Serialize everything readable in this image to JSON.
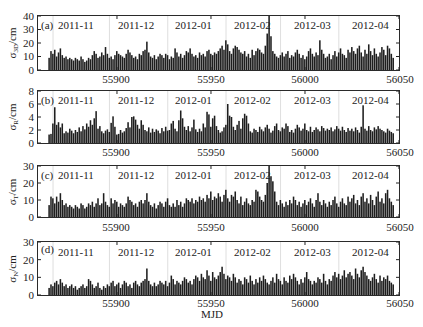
{
  "figure": {
    "xlabel": "MJD"
  },
  "chart_data": [
    {
      "type": "bar",
      "panel": "(a)",
      "ylabel": {
        "symbol": "σ",
        "sub": "3D",
        "unit": "/cm"
      },
      "xlabel": "MJD",
      "xlim": [
        55858,
        56050
      ],
      "ylim": [
        0,
        40
      ],
      "xticks": [
        "55900",
        "55950",
        "56000",
        "56050"
      ],
      "yticks": [
        "0",
        "10",
        "20",
        "30",
        "40"
      ],
      "months": [
        "2011-11",
        "2011-12",
        "2012-01",
        "2012-02",
        "2012-03",
        "2012-04"
      ],
      "month_starts": [
        55866,
        55896,
        55927,
        55958,
        55987,
        56018
      ],
      "x": {
        "start": 55864,
        "step": 1,
        "count": 184
      },
      "values": [
        9,
        14,
        12,
        15,
        10,
        13,
        16,
        11,
        9,
        10,
        8,
        9,
        8,
        7,
        9,
        8,
        7,
        10,
        8,
        6,
        7,
        9,
        8,
        11,
        14,
        12,
        9,
        10,
        13,
        11,
        17,
        12,
        9,
        10,
        8,
        11,
        14,
        12,
        11,
        10,
        9,
        12,
        15,
        13,
        11,
        9,
        10,
        8,
        12,
        11,
        14,
        15,
        21,
        13,
        10,
        9,
        11,
        8,
        10,
        12,
        11,
        9,
        12,
        11,
        8,
        10,
        9,
        16,
        13,
        10,
        12,
        9,
        11,
        14,
        13,
        16,
        12,
        10,
        11,
        9,
        13,
        11,
        12,
        10,
        14,
        15,
        12,
        11,
        13,
        12,
        14,
        16,
        18,
        15,
        22,
        19,
        14,
        12,
        16,
        18,
        17,
        15,
        13,
        12,
        14,
        10,
        12,
        9,
        15,
        11,
        14,
        16,
        15,
        13,
        12,
        18,
        27,
        40,
        25,
        14,
        12,
        10,
        9,
        11,
        13,
        10,
        12,
        14,
        9,
        11,
        10,
        13,
        15,
        12,
        9,
        11,
        8,
        10,
        14,
        16,
        12,
        10,
        13,
        11,
        22,
        15,
        12,
        9,
        10,
        12,
        8,
        11,
        14,
        10,
        13,
        16,
        12,
        11,
        9,
        15,
        13,
        17,
        14,
        12,
        16,
        18,
        13,
        10,
        15,
        12,
        19,
        14,
        11,
        16,
        12,
        10,
        13,
        17,
        15,
        11,
        18,
        16,
        12,
        9
      ]
    },
    {
      "type": "bar",
      "panel": "(b)",
      "ylabel": {
        "symbol": "σ",
        "sub": "R",
        "unit": "/cm"
      },
      "xlabel": "MJD",
      "xlim": [
        55858,
        56050
      ],
      "ylim": [
        0,
        8
      ],
      "xticks": [
        "55900",
        "55950",
        "56000",
        "56050"
      ],
      "yticks": [
        "0",
        "2",
        "4",
        "6",
        "8"
      ],
      "months": [
        "2011-11",
        "2011-12",
        "2012-01",
        "2012-02",
        "2012-03",
        "2012-04"
      ],
      "month_starts": [
        55866,
        55896,
        55927,
        55958,
        55987,
        56018
      ],
      "x": {
        "start": 55864,
        "step": 1,
        "count": 184
      },
      "values": [
        1.3,
        1.4,
        3.0,
        5.5,
        2.8,
        3.2,
        2.4,
        3.0,
        1.5,
        1.8,
        1.6,
        2.2,
        1.9,
        1.5,
        2.0,
        1.7,
        2.4,
        1.8,
        2.6,
        2.1,
        3.0,
        2.5,
        3.5,
        2.8,
        3.8,
        4.9,
        2.2,
        2.6,
        1.8,
        1.5,
        1.9,
        2.1,
        1.7,
        3.1,
        4.1,
        2.5,
        1.3,
        1.4,
        2.0,
        1.6,
        1.8,
        2.3,
        3.2,
        2.4,
        4.0,
        4.1,
        3.6,
        2.8,
        2.2,
        3.5,
        2.8,
        2.0,
        1.8,
        2.4,
        1.6,
        2.2,
        1.7,
        2.1,
        1.9,
        1.5,
        2.3,
        1.8,
        2.5,
        1.9,
        2.0,
        3.0,
        3.4,
        2.2,
        1.8,
        3.5,
        5.0,
        3.8,
        2.5,
        2.0,
        2.6,
        1.8,
        2.4,
        3.6,
        2.1,
        1.7,
        2.2,
        1.8,
        3.0,
        2.4,
        4.8,
        4.4,
        2.5,
        3.8,
        4.2,
        2.6,
        2.0,
        1.6,
        1.8,
        2.4,
        2.8,
        6.0,
        4.2,
        4.0,
        2.5,
        2.0,
        2.8,
        3.4,
        2.2,
        3.8,
        4.5,
        4.2,
        3.0,
        1.8,
        1.6,
        2.2,
        2.0,
        1.7,
        2.5,
        2.1,
        1.8,
        2.4,
        2.8,
        2.2,
        1.6,
        1.9,
        2.6,
        3.0,
        2.0,
        1.8,
        2.4,
        2.2,
        3.0,
        2.6,
        1.7,
        2.0,
        1.6,
        2.2,
        2.8,
        2.4,
        1.9,
        2.2,
        3.0,
        2.0,
        1.8,
        2.5,
        1.7,
        2.0,
        2.4,
        2.1,
        1.8,
        2.6,
        2.3,
        1.9,
        2.2,
        2.0,
        2.4,
        1.8,
        2.1,
        2.6,
        2.2,
        1.9,
        2.5,
        2.0,
        1.7,
        2.3,
        1.9,
        2.2,
        1.8,
        2.4,
        2.0,
        1.6,
        2.5,
        5.8,
        2.2,
        1.9,
        2.6,
        2.0,
        1.8,
        2.4,
        2.1,
        2.6,
        2.2,
        2.0,
        1.8,
        1.6,
        2.2,
        1.9,
        1.7,
        1.5
      ]
    },
    {
      "type": "bar",
      "panel": "(c)",
      "ylabel": {
        "symbol": "σ",
        "sub": "T",
        "unit": "/cm"
      },
      "xlabel": "MJD",
      "xlim": [
        55858,
        56050
      ],
      "ylim": [
        0,
        30
      ],
      "xticks": [
        "55900",
        "55950",
        "56000",
        "56050"
      ],
      "yticks": [
        "0",
        "10",
        "20",
        "30"
      ],
      "months": [
        "2011-11",
        "2011-12",
        "2012-01",
        "2012-02",
        "2012-03",
        "2012-04"
      ],
      "month_starts": [
        55866,
        55896,
        55927,
        55958,
        55987,
        56018
      ],
      "x": {
        "start": 55864,
        "step": 1,
        "count": 184
      },
      "values": [
        7,
        12,
        11,
        8,
        12,
        9,
        14,
        10,
        7,
        8,
        6,
        7,
        6,
        5,
        7,
        6,
        5,
        8,
        7,
        5,
        6,
        8,
        7,
        9,
        6,
        8,
        11,
        7,
        8,
        14,
        9,
        7,
        6,
        11,
        8,
        10,
        9,
        6,
        8,
        7,
        6,
        8,
        12,
        10,
        9,
        7,
        8,
        6,
        9,
        10,
        8,
        10,
        14,
        9,
        7,
        6,
        8,
        5,
        7,
        9,
        8,
        6,
        9,
        11,
        7,
        6,
        8,
        6,
        10,
        7,
        9,
        6,
        8,
        11,
        10,
        9,
        11,
        8,
        10,
        9,
        12,
        10,
        11,
        9,
        13,
        11,
        15,
        10,
        12,
        11,
        14,
        12,
        9,
        13,
        16,
        11,
        9,
        13,
        12,
        15,
        10,
        8,
        12,
        7,
        9,
        11,
        8,
        7,
        10,
        9,
        16,
        15,
        12,
        10,
        9,
        13,
        20,
        30,
        24,
        21,
        15,
        9,
        7,
        10,
        8,
        6,
        9,
        7,
        10,
        8,
        12,
        10,
        7,
        9,
        6,
        8,
        10,
        7,
        9,
        11,
        8,
        6,
        10,
        14,
        9,
        7,
        10,
        8,
        6,
        9,
        7,
        10,
        12,
        8,
        6,
        9,
        11,
        8,
        7,
        12,
        9,
        11,
        13,
        8,
        10,
        7,
        12,
        14,
        9,
        11,
        8,
        13,
        10,
        7,
        12,
        15,
        9,
        11,
        8,
        14,
        16,
        11,
        9,
        7
      ]
    },
    {
      "type": "bar",
      "panel": "(d)",
      "ylabel": {
        "symbol": "σ",
        "sub": "N",
        "unit": "/cm"
      },
      "xlabel": "MJD",
      "xlim": [
        55858,
        56050
      ],
      "ylim": [
        0,
        30
      ],
      "xticks": [
        "55900",
        "55950",
        "56000",
        "56050"
      ],
      "yticks": [
        "0",
        "10",
        "20",
        "30"
      ],
      "months": [
        "2011-11",
        "2011-12",
        "2012-01",
        "2012-02",
        "2012-03",
        "2012-04"
      ],
      "month_starts": [
        55866,
        55896,
        55927,
        55958,
        55987,
        56018
      ],
      "x": {
        "start": 55864,
        "step": 1,
        "count": 184
      },
      "values": [
        4,
        6,
        5,
        7,
        8,
        6,
        9,
        7,
        5,
        6,
        4,
        5,
        6,
        4,
        5,
        3,
        4,
        5,
        6,
        4,
        5,
        9,
        8,
        6,
        4,
        5,
        7,
        4,
        3,
        5,
        4,
        6,
        5,
        7,
        8,
        5,
        6,
        7,
        4,
        6,
        8,
        7,
        5,
        6,
        4,
        7,
        8,
        6,
        5,
        7,
        8,
        9,
        15,
        8,
        6,
        5,
        7,
        5,
        6,
        8,
        7,
        6,
        8,
        5,
        7,
        11,
        9,
        6,
        8,
        7,
        6,
        8,
        10,
        9,
        7,
        8,
        6,
        9,
        11,
        10,
        8,
        12,
        10,
        9,
        14,
        11,
        8,
        13,
        10,
        9,
        11,
        13,
        16,
        12,
        9,
        11,
        10,
        8,
        12,
        10,
        7,
        9,
        8,
        6,
        10,
        9,
        7,
        11,
        8,
        6,
        9,
        7,
        10,
        8,
        11,
        9,
        7,
        6,
        8,
        10,
        7,
        12,
        9,
        8,
        6,
        10,
        8,
        7,
        11,
        9,
        12,
        10,
        8,
        6,
        9,
        7,
        10,
        13,
        9,
        8,
        6,
        8,
        7,
        10,
        9,
        7,
        12,
        8,
        6,
        9,
        8,
        11,
        13,
        10,
        12,
        9,
        11,
        14,
        10,
        12,
        13,
        11,
        9,
        15,
        12,
        10,
        14,
        16,
        13,
        11,
        9,
        8,
        10,
        12,
        9,
        7,
        11,
        8,
        10,
        9,
        11,
        8,
        7,
        6
      ]
    }
  ]
}
